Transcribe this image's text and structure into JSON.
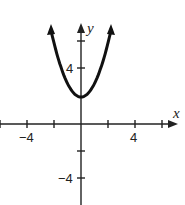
{
  "chart_data": {
    "type": "line",
    "title": "",
    "function": "y = x^2 + 2",
    "xlabel": "x",
    "ylabel": "y",
    "xlim": [
      -6,
      7.5
    ],
    "ylim": [
      -6,
      9
    ],
    "x_tick_labels": [
      "-4",
      "4"
    ],
    "y_tick_labels": [
      "4",
      "-4"
    ],
    "x_ticks": [
      -6,
      -4,
      -2,
      2,
      4,
      6
    ],
    "y_ticks": [
      -4,
      -2,
      4,
      6
    ],
    "series": [
      {
        "name": "parabola",
        "x": [
          -2.3,
          -2,
          -1.5,
          -1,
          -0.5,
          0,
          0.5,
          1,
          1.5,
          2,
          2.3
        ],
        "values": [
          7.29,
          6,
          4.25,
          3,
          2.25,
          2,
          2.25,
          3,
          4.25,
          6,
          7.29
        ]
      }
    ],
    "grid": false,
    "legend": "none"
  },
  "labels": {
    "x_axis": "x",
    "y_axis": "y",
    "x_neg4": "−4",
    "x_pos4": "4",
    "y_pos4": "4",
    "y_neg4": "−4"
  }
}
